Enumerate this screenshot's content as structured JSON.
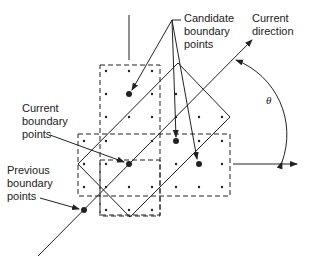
{
  "labels": {
    "candidate": [
      "Candidate",
      "boundary",
      "points"
    ],
    "current_direction": [
      "Current",
      "direction"
    ],
    "current_boundary": [
      "Current",
      "boundary",
      "points"
    ],
    "previous_boundary": [
      "Previous",
      "boundary",
      "points"
    ],
    "theta": "θ"
  },
  "colors": {
    "ink": "#222222",
    "background": "#ffffff"
  }
}
